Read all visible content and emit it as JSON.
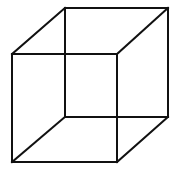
{
  "figure": {
    "type": "necker-cube",
    "stroke_color": "#111111",
    "background": "#ffffff",
    "stroke_width": 2,
    "front_face": {
      "tl": [
        12,
        54
      ],
      "tr": [
        117,
        54
      ],
      "br": [
        117,
        162
      ],
      "bl": [
        12,
        162
      ]
    },
    "back_face": {
      "tl": [
        65,
        8
      ],
      "tr": [
        168,
        8
      ],
      "br": [
        168,
        117
      ],
      "bl": [
        65,
        117
      ]
    }
  }
}
